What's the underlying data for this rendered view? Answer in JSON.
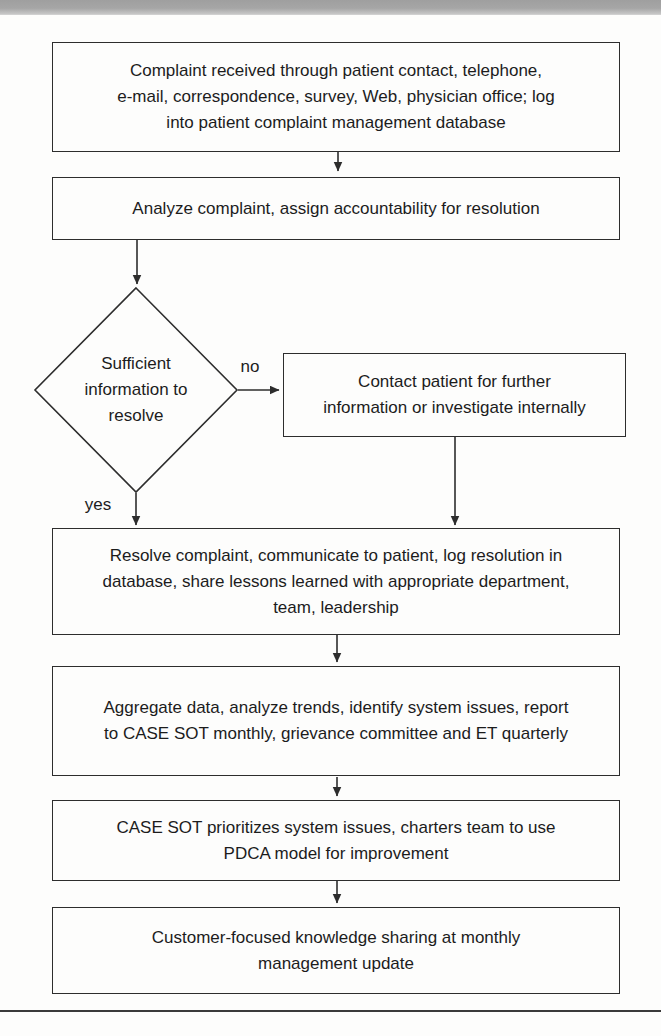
{
  "page": {
    "background_color": "#fdfdfc",
    "line_color": "#2d2d2d",
    "text_color": "#1c1c1c",
    "top_bar_color": "#a6a6a6",
    "bottom_rule_color": "#3b3b3b"
  },
  "flowchart": {
    "nodes": {
      "received": {
        "shape": "rectangle",
        "lines": [
          "Complaint received through patient contact, telephone,",
          "e-mail, correspondence, survey, Web, physician office; log",
          "into patient complaint management database"
        ]
      },
      "analyze": {
        "shape": "rectangle",
        "lines": [
          "Analyze complaint, assign accountability for resolution"
        ]
      },
      "decision": {
        "shape": "diamond",
        "lines": [
          "Sufficient",
          "information to",
          "resolve"
        ]
      },
      "contact": {
        "shape": "rectangle",
        "lines": [
          "Contact patient for further",
          "information or investigate internally"
        ]
      },
      "resolve": {
        "shape": "rectangle",
        "lines": [
          "Resolve complaint, communicate to patient, log resolution in",
          "database, share lessons learned with appropriate department,",
          "team, leadership"
        ]
      },
      "aggregate": {
        "shape": "rectangle",
        "lines": [
          "Aggregate data, analyze trends, identify system issues, report",
          "to CASE SOT monthly, grievance committee and ET quarterly"
        ]
      },
      "prioritize": {
        "shape": "rectangle",
        "lines": [
          "CASE SOT prioritizes system issues, charters team to use",
          "PDCA model for improvement"
        ]
      },
      "share": {
        "shape": "rectangle",
        "lines": [
          "Customer-focused knowledge sharing at monthly",
          "management update"
        ]
      }
    },
    "branch_labels": {
      "no": "no",
      "yes": "yes"
    }
  }
}
